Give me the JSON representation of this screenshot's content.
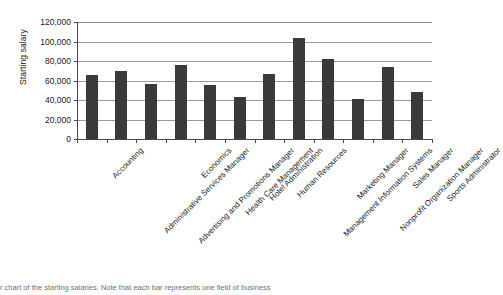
{
  "chart_data": {
    "type": "bar",
    "title": "",
    "xlabel": "",
    "ylabel": "Starting salary",
    "ylim": [
      0,
      120000
    ],
    "ytick_step": 20000,
    "grid": true,
    "legend": "none",
    "bar_color": "#3a3a3a",
    "categories": [
      "Accounting",
      "Administrative Services Manager",
      "Advertising and Promotions Manager",
      "Economics",
      "Health Care Management",
      "Hotel Administration",
      "Human Resources",
      "Management Information Systems",
      "Marketing Manager",
      "Nonprofit Organization Manager",
      "Sales Manager",
      "Sports Administrator"
    ],
    "values": [
      66000,
      70000,
      56000,
      76000,
      55000,
      43000,
      67000,
      104000,
      82000,
      41000,
      74000,
      48000
    ],
    "ytick_labels": [
      "120,000",
      "100,000",
      "80,000",
      "60,000",
      "40,000",
      "20,000",
      "0"
    ],
    "ytick_values": [
      120000,
      100000,
      80000,
      60000,
      40000,
      20000,
      0
    ]
  },
  "caption": {
    "text": "r chart of the starting salaries. Note that each bar represents one field of business"
  }
}
